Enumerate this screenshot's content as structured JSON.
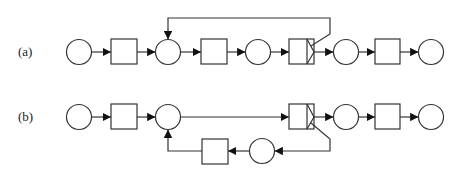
{
  "diagram": {
    "type": "petri-net",
    "rows": [
      {
        "id": "a",
        "label": "(a)",
        "nodes": [
          "place",
          "transition",
          "place",
          "transition",
          "place",
          "split-transition",
          "place",
          "transition",
          "place"
        ],
        "feedback": "split-transition loops back above to place 2"
      },
      {
        "id": "b",
        "label": "(b)",
        "nodes": [
          "place",
          "transition",
          "place",
          "split-transition",
          "place",
          "transition",
          "place"
        ],
        "feedback": "split-transition loops back below through place and transition to place 2"
      }
    ],
    "colors": {
      "stroke": "#333333",
      "background": "#ffffff"
    }
  }
}
